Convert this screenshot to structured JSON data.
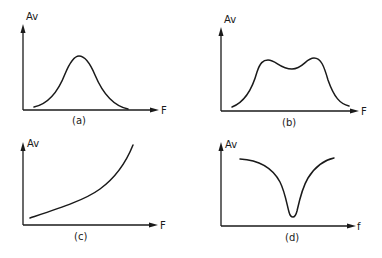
{
  "figure": {
    "panels": [
      {
        "id": "a",
        "caption": "(a)",
        "y_label": "Av",
        "x_label": "F",
        "shape": "single-peak bandpass (bell curve)"
      },
      {
        "id": "b",
        "caption": "(b)",
        "y_label": "Av",
        "x_label": "F",
        "shape": "double-hump bandpass with center dip"
      },
      {
        "id": "c",
        "caption": "(c)",
        "y_label": "Av",
        "x_label": "F",
        "shape": "monotonically rising (high-frequency boost)"
      },
      {
        "id": "d",
        "caption": "(d)",
        "y_label": "Av",
        "x_label": "f",
        "shape": "notch (band-reject)"
      }
    ]
  }
}
